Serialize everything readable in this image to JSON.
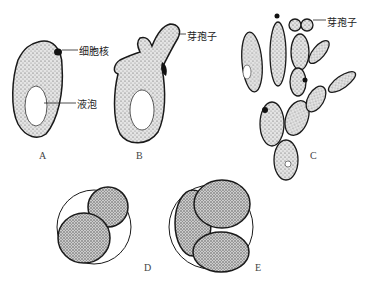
{
  "diagram": {
    "colors": {
      "stroke": "#1a1a1a",
      "fill": "#d9d9d9",
      "dot": "#555555",
      "nucleus": "#111111",
      "background": "#ffffff"
    },
    "panels": [
      {
        "id": "A",
        "label": "A",
        "annotations": [
          "细胞核",
          "液泡"
        ]
      },
      {
        "id": "B",
        "label": "B",
        "annotations": [
          "芽孢子"
        ]
      },
      {
        "id": "C",
        "label": "C",
        "annotations": [
          "芽孢子"
        ]
      },
      {
        "id": "D",
        "label": "D",
        "annotations": []
      },
      {
        "id": "E",
        "label": "E",
        "annotations": []
      }
    ],
    "annotations": {
      "nucleus": "细胞核",
      "vacuole": "液泡",
      "bud_b": "芽孢子",
      "bud_c": "芽孢子"
    }
  }
}
